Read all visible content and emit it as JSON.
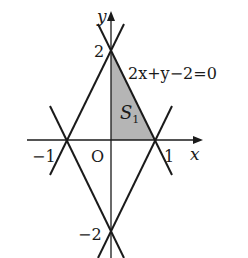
{
  "diagram": {
    "type": "coordinate-plane-figure",
    "axes": {
      "x_label": "x",
      "y_label": "y",
      "origin_label": "O"
    },
    "tick_labels": {
      "x_neg1": "−1",
      "x_pos1": "1",
      "y_pos2": "2",
      "y_neg2": "−2"
    },
    "equation_label": "2x+y−2=0",
    "region_label": {
      "main": "S",
      "subscript": "1"
    },
    "lines": [
      {
        "name": "2x+y-2=0",
        "through": [
          [
            0,
            2
          ],
          [
            1,
            0
          ]
        ]
      },
      {
        "name": "-2x+y-2=0",
        "through": [
          [
            0,
            2
          ],
          [
            -1,
            0
          ]
        ]
      },
      {
        "name": "2x-y-2=0",
        "through": [
          [
            0,
            -2
          ],
          [
            1,
            0
          ]
        ]
      },
      {
        "name": "-2x-y-2=0",
        "through": [
          [
            0,
            -2
          ],
          [
            -1,
            0
          ]
        ]
      }
    ],
    "shaded_region": {
      "vertices": [
        [
          0,
          0
        ],
        [
          0,
          2
        ],
        [
          1,
          0
        ]
      ],
      "fill": "#b5b5b5"
    },
    "colors": {
      "line": "#1a1a1a",
      "shade": "#b5b5b5",
      "background": "#ffffff"
    }
  }
}
